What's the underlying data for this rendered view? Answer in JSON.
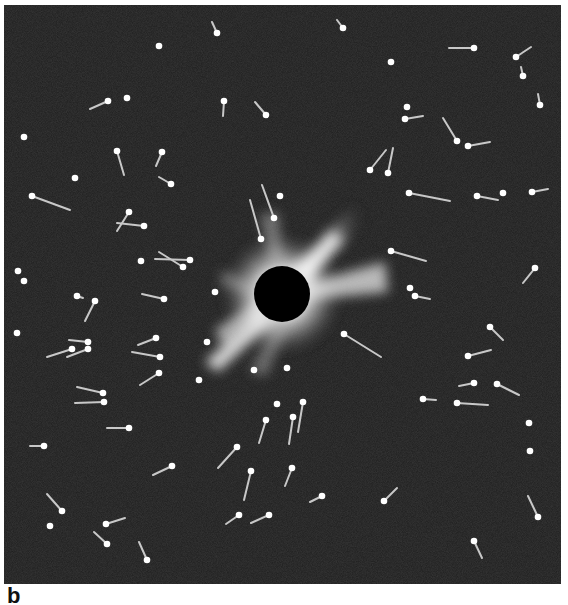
{
  "figure": {
    "panel_label": "b",
    "background_color": "#1c1c1c",
    "star_color": "#ffffff",
    "trail_color": "#c8c8c8",
    "eclipse": {
      "center": [
        282,
        294
      ],
      "disk_radius": 28,
      "disk_color": "#000000",
      "corona_color": "#ffffff"
    },
    "stars": [
      {
        "x": 159,
        "y": 46
      },
      {
        "x": 127,
        "y": 98
      },
      {
        "x": 24,
        "y": 137
      },
      {
        "x": 75,
        "y": 178
      },
      {
        "x": 391,
        "y": 62
      },
      {
        "x": 407,
        "y": 107
      },
      {
        "x": 280,
        "y": 196
      },
      {
        "x": 503,
        "y": 193
      },
      {
        "x": 141,
        "y": 261
      },
      {
        "x": 18,
        "y": 271
      },
      {
        "x": 24,
        "y": 281
      },
      {
        "x": 17,
        "y": 333
      },
      {
        "x": 215,
        "y": 292
      },
      {
        "x": 207,
        "y": 342
      },
      {
        "x": 199,
        "y": 380
      },
      {
        "x": 254,
        "y": 370
      },
      {
        "x": 287,
        "y": 368
      },
      {
        "x": 277,
        "y": 404
      },
      {
        "x": 410,
        "y": 288
      },
      {
        "x": 529,
        "y": 423
      },
      {
        "x": 530,
        "y": 451
      },
      {
        "x": 50,
        "y": 526
      }
    ],
    "streaks": [
      {
        "x": 217,
        "y": 33,
        "tx": 212,
        "ty": 22
      },
      {
        "x": 343,
        "y": 28,
        "tx": 337,
        "ty": 20
      },
      {
        "x": 108,
        "y": 101,
        "tx": 90,
        "ty": 109
      },
      {
        "x": 224,
        "y": 101,
        "tx": 223,
        "ty": 116
      },
      {
        "x": 266,
        "y": 115,
        "tx": 255,
        "ty": 102
      },
      {
        "x": 117,
        "y": 151,
        "tx": 124,
        "ty": 175
      },
      {
        "x": 162,
        "y": 152,
        "tx": 156,
        "ty": 166
      },
      {
        "x": 171,
        "y": 184,
        "tx": 159,
        "ty": 177
      },
      {
        "x": 474,
        "y": 48,
        "tx": 449,
        "ty": 48
      },
      {
        "x": 516,
        "y": 57,
        "tx": 531,
        "ty": 47
      },
      {
        "x": 523,
        "y": 76,
        "tx": 521,
        "ty": 67
      },
      {
        "x": 540,
        "y": 105,
        "tx": 538,
        "ty": 94
      },
      {
        "x": 405,
        "y": 119,
        "tx": 423,
        "ty": 116
      },
      {
        "x": 457,
        "y": 141,
        "tx": 443,
        "ty": 118
      },
      {
        "x": 468,
        "y": 146,
        "tx": 490,
        "ty": 142
      },
      {
        "x": 370,
        "y": 170,
        "tx": 386,
        "ty": 150
      },
      {
        "x": 388,
        "y": 173,
        "tx": 393,
        "ty": 148
      },
      {
        "x": 274,
        "y": 218,
        "tx": 262,
        "ty": 185
      },
      {
        "x": 261,
        "y": 239,
        "tx": 250,
        "ty": 200
      },
      {
        "x": 32,
        "y": 196,
        "tx": 70,
        "ty": 210
      },
      {
        "x": 409,
        "y": 193,
        "tx": 450,
        "ty": 201
      },
      {
        "x": 477,
        "y": 196,
        "tx": 498,
        "ty": 200
      },
      {
        "x": 532,
        "y": 192,
        "tx": 548,
        "ty": 189
      },
      {
        "x": 129,
        "y": 212,
        "tx": 117,
        "ty": 231
      },
      {
        "x": 144,
        "y": 226,
        "tx": 117,
        "ty": 223
      },
      {
        "x": 190,
        "y": 260,
        "tx": 155,
        "ty": 259
      },
      {
        "x": 183,
        "y": 267,
        "tx": 159,
        "ty": 252
      },
      {
        "x": 391,
        "y": 251,
        "tx": 426,
        "ty": 261
      },
      {
        "x": 535,
        "y": 268,
        "tx": 523,
        "ty": 283
      },
      {
        "x": 77,
        "y": 296,
        "tx": 83,
        "ty": 298
      },
      {
        "x": 95,
        "y": 301,
        "tx": 85,
        "ty": 321
      },
      {
        "x": 164,
        "y": 299,
        "tx": 142,
        "ty": 294
      },
      {
        "x": 415,
        "y": 296,
        "tx": 430,
        "ty": 299
      },
      {
        "x": 490,
        "y": 327,
        "tx": 503,
        "ty": 340
      },
      {
        "x": 344,
        "y": 334,
        "tx": 381,
        "ty": 357
      },
      {
        "x": 88,
        "y": 342,
        "tx": 69,
        "ty": 340
      },
      {
        "x": 88,
        "y": 349,
        "tx": 67,
        "ty": 357
      },
      {
        "x": 72,
        "y": 349,
        "tx": 47,
        "ty": 357
      },
      {
        "x": 156,
        "y": 338,
        "tx": 138,
        "ty": 345
      },
      {
        "x": 160,
        "y": 357,
        "tx": 132,
        "ty": 352
      },
      {
        "x": 159,
        "y": 373,
        "tx": 140,
        "ty": 385
      },
      {
        "x": 468,
        "y": 356,
        "tx": 491,
        "ty": 350
      },
      {
        "x": 474,
        "y": 383,
        "tx": 459,
        "ty": 386
      },
      {
        "x": 497,
        "y": 384,
        "tx": 519,
        "ty": 395
      },
      {
        "x": 103,
        "y": 393,
        "tx": 77,
        "ty": 387
      },
      {
        "x": 104,
        "y": 402,
        "tx": 75,
        "ty": 403
      },
      {
        "x": 423,
        "y": 399,
        "tx": 436,
        "ty": 400
      },
      {
        "x": 457,
        "y": 403,
        "tx": 488,
        "ty": 405
      },
      {
        "x": 303,
        "y": 402,
        "tx": 298,
        "ty": 432
      },
      {
        "x": 266,
        "y": 420,
        "tx": 259,
        "ty": 443
      },
      {
        "x": 293,
        "y": 417,
        "tx": 289,
        "ty": 444
      },
      {
        "x": 129,
        "y": 428,
        "tx": 107,
        "ty": 428
      },
      {
        "x": 44,
        "y": 446,
        "tx": 30,
        "ty": 446
      },
      {
        "x": 237,
        "y": 447,
        "tx": 218,
        "ty": 468
      },
      {
        "x": 172,
        "y": 466,
        "tx": 153,
        "ty": 475
      },
      {
        "x": 251,
        "y": 471,
        "tx": 244,
        "ty": 500
      },
      {
        "x": 292,
        "y": 468,
        "tx": 285,
        "ty": 486
      },
      {
        "x": 322,
        "y": 496,
        "tx": 310,
        "ty": 502
      },
      {
        "x": 384,
        "y": 501,
        "tx": 397,
        "ty": 488
      },
      {
        "x": 62,
        "y": 511,
        "tx": 47,
        "ty": 494
      },
      {
        "x": 239,
        "y": 515,
        "tx": 226,
        "ty": 524
      },
      {
        "x": 269,
        "y": 515,
        "tx": 251,
        "ty": 523
      },
      {
        "x": 106,
        "y": 524,
        "tx": 125,
        "ty": 518
      },
      {
        "x": 538,
        "y": 517,
        "tx": 528,
        "ty": 496
      },
      {
        "x": 107,
        "y": 544,
        "tx": 94,
        "ty": 532
      },
      {
        "x": 474,
        "y": 541,
        "tx": 482,
        "ty": 558
      },
      {
        "x": 147,
        "y": 560,
        "tx": 139,
        "ty": 542
      }
    ]
  }
}
